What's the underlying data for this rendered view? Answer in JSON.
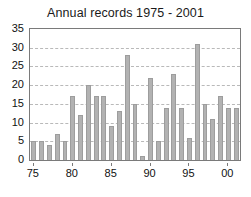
{
  "chart_data": {
    "type": "bar",
    "title": "Annual records 1975 - 2001",
    "xlabel": "",
    "ylabel": "",
    "categories": [
      "1975",
      "1976",
      "1977",
      "1978",
      "1979",
      "1980",
      "1981",
      "1982",
      "1983",
      "1984",
      "1985",
      "1986",
      "1987",
      "1988",
      "1989",
      "1990",
      "1991",
      "1992",
      "1993",
      "1994",
      "1995",
      "1996",
      "1997",
      "1998",
      "1999",
      "2000",
      "2001"
    ],
    "values": [
      5,
      5,
      4,
      7,
      5,
      17,
      12,
      20,
      17,
      17,
      9,
      13,
      28,
      15,
      1,
      22,
      5,
      14,
      23,
      14,
      6,
      31,
      15,
      11,
      17,
      14,
      14
    ],
    "ylim": [
      0,
      35
    ],
    "yticks": [
      0,
      5,
      10,
      15,
      20,
      25,
      30,
      35
    ],
    "ytick_labels": [
      "0",
      "5",
      "10",
      "15",
      "20",
      "25",
      "30",
      "35"
    ],
    "xtick_labels": [
      "75",
      "80",
      "85",
      "90",
      "95",
      "00"
    ],
    "xtick_categories": [
      "1975",
      "1980",
      "1985",
      "1990",
      "1995",
      "2000"
    ],
    "grid": true,
    "grid_axis": "y",
    "legend": false,
    "legend_position": "none",
    "bar_color": "#b2b2b2",
    "bar_edge_color": "#9d9d9d",
    "grid_color": "#b9b9b9",
    "axis_color": "#7a7a7a",
    "text_color": "#111111",
    "background_color": "#ffffff"
  }
}
